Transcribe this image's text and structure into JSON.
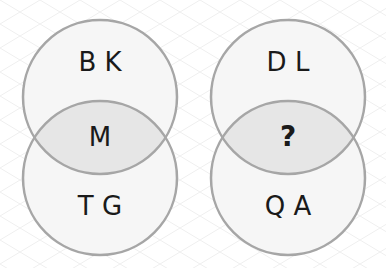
{
  "puzzle": {
    "left": {
      "top": "B K",
      "middle": "M",
      "bottom": "T G"
    },
    "right": {
      "top": "D L",
      "middle": "?",
      "bottom": "Q A"
    }
  },
  "colors": {
    "background": "#ffffff",
    "grid": "#eeeeee",
    "circle_fill": "#f6f6f6",
    "overlap_fill": "#e6e6e6",
    "circle_stroke": "#a6a6a6",
    "text": "#1a1a1a"
  }
}
